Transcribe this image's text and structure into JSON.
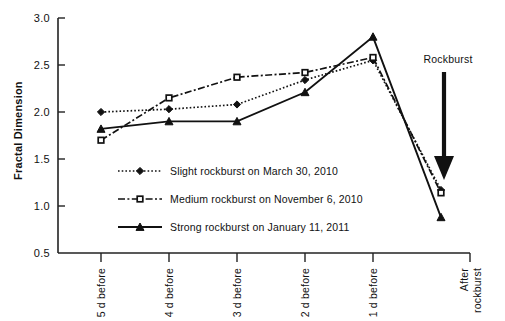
{
  "chart_data": {
    "type": "line",
    "title": "",
    "xlabel": "",
    "ylabel": "Fractal Dimension",
    "categories": [
      "5 d before",
      "4 d before",
      "3 d before",
      "2 d before",
      "1 d before",
      "After rockburst"
    ],
    "ylim": [
      0.5,
      3.0
    ],
    "ytick_labels": [
      "3.0",
      "2.5",
      "2.0",
      "1.5",
      "1.0",
      "0.5"
    ],
    "ytick_values": [
      3.0,
      2.5,
      2.0,
      1.5,
      1.0,
      0.5
    ],
    "grid": false,
    "legend_position": "inside-lower-left",
    "series": [
      {
        "name": "Slight rockburst on March 30, 2010",
        "marker": "diamond-filled",
        "line_style": "dotted",
        "values": [
          2.0,
          2.03,
          2.08,
          2.34,
          2.55,
          1.17
        ]
      },
      {
        "name": "Medium rockburst on November 6, 2010",
        "marker": "square-open",
        "line_style": "dash-dot",
        "values": [
          1.7,
          2.15,
          2.37,
          2.42,
          2.58,
          1.14
        ]
      },
      {
        "name": "Strong rockburst on January 11, 2011",
        "marker": "triangle-filled",
        "line_style": "solid",
        "values": [
          1.82,
          1.9,
          1.9,
          2.21,
          2.8,
          0.88
        ]
      }
    ],
    "annotations": [
      {
        "text": "Rockburst",
        "type": "down-arrow-label",
        "x_category": "After rockburst",
        "y_value": 1.55
      }
    ]
  },
  "colors": {
    "ink": "#111111",
    "background": "#ffffff"
  }
}
